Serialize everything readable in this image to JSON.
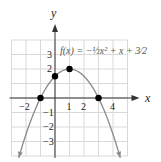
{
  "chart_data": {
    "type": "line",
    "title_display": "f(x) = −½x² + x + 3⁄2",
    "xlabel": "x",
    "ylabel": "y",
    "xlim": [
      -3,
      5
    ],
    "ylim": [
      -4,
      4
    ],
    "grid": true,
    "x_tick_labels": [
      "-2",
      "1",
      "2",
      "4"
    ],
    "x_ticks": [
      -2,
      1,
      2,
      4
    ],
    "y_tick_labels": [
      "3",
      "2",
      "-1",
      "-2",
      "-3"
    ],
    "y_ticks": [
      3,
      2,
      -1,
      -2,
      -3
    ],
    "function": {
      "a": -0.5,
      "b": 1,
      "c": 1.5
    },
    "points": [
      {
        "x": -1,
        "y": 0,
        "label": "x-intercept"
      },
      {
        "x": 0,
        "y": 1.5,
        "label": "y-intercept"
      },
      {
        "x": 1,
        "y": 2,
        "label": "vertex"
      },
      {
        "x": 3,
        "y": 0,
        "label": "x-intercept"
      }
    ],
    "colors": {
      "curve": "#8a8a8a",
      "grid": "#d9d9d9",
      "axis": "#333333",
      "points": "#000000"
    }
  }
}
